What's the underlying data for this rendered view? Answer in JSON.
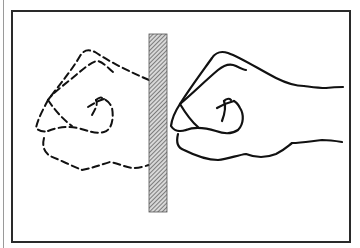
{
  "figure": {
    "colors": {
      "ink": "#111111",
      "frame": "#2a2a2a",
      "barrier_fill": "#8c8c8c",
      "background": "#ffffff"
    },
    "elements": [
      {
        "name": "fist-dashed",
        "style": "dashed",
        "side": "left"
      },
      {
        "name": "barrier",
        "style": "hatched",
        "position": "center"
      },
      {
        "name": "fist-solid",
        "style": "solid",
        "side": "right"
      }
    ]
  }
}
